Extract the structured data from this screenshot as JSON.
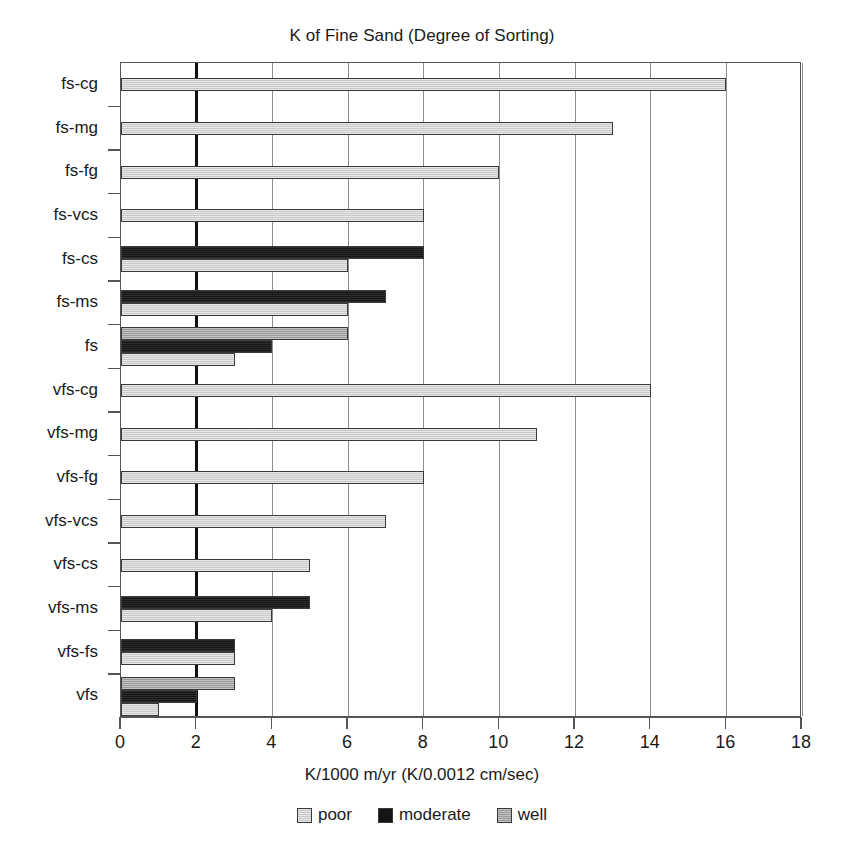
{
  "chart_data": {
    "type": "bar",
    "orientation": "horizontal",
    "grouped": true,
    "title": "K of Fine Sand (Degree of Sorting)",
    "xlabel": "K/1000 m/yr (K/0.0012 cm/sec)",
    "ylabel": "",
    "xlim": [
      0,
      18
    ],
    "xticks": [
      0,
      2,
      4,
      6,
      8,
      10,
      12,
      14,
      16,
      18
    ],
    "xtick_labels": [
      "0",
      "2",
      "4",
      "6",
      "8",
      "10",
      "12",
      "14",
      "16",
      "18"
    ],
    "grid": true,
    "grid_axis": "x",
    "legend_position": "bottom",
    "categories": [
      "fs-cg",
      "fs-mg",
      "fs-fg",
      "fs-vcs",
      "fs-cs",
      "fs-ms",
      "fs",
      "vfs-cg",
      "vfs-mg",
      "vfs-fg",
      "vfs-vcs",
      "vfs-cs",
      "vfs-ms",
      "vfs-fs",
      "vfs"
    ],
    "series": [
      {
        "name": "poor",
        "color": "#c9c9c9",
        "values": [
          16,
          13,
          10,
          8,
          6,
          6,
          3,
          14,
          11,
          8,
          7,
          5,
          4,
          3,
          1
        ]
      },
      {
        "name": "moderate",
        "color": "#151515",
        "values": [
          null,
          null,
          null,
          null,
          8,
          7,
          4,
          null,
          null,
          null,
          null,
          null,
          5,
          3,
          2
        ]
      },
      {
        "name": "well",
        "color": "#9a9a9a",
        "values": [
          null,
          null,
          null,
          null,
          null,
          null,
          6,
          null,
          null,
          null,
          null,
          null,
          null,
          null,
          3
        ]
      }
    ],
    "legend": [
      {
        "label": "poor",
        "swatch": "#c9c9c9"
      },
      {
        "label": "moderate",
        "swatch": "#151515"
      },
      {
        "label": "well",
        "swatch": "#9a9a9a"
      }
    ],
    "emphasis_gridline": 2
  }
}
